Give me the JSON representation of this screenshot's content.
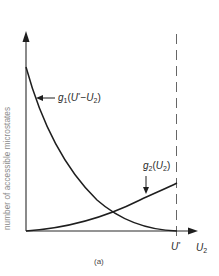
{
  "figure": {
    "caption": "(a)",
    "y_axis_label": "number of accessible microstates",
    "x_axis_label": {
      "base": "U",
      "sub": "2"
    },
    "marker_label": {
      "base": "U",
      "sup": "*"
    },
    "curves": {
      "g1": {
        "name": "g",
        "sub": "1",
        "arg_open": "(",
        "arg_base": "U",
        "arg_sup": "*",
        "arg_minus": "−",
        "arg_u": "U",
        "arg_sub": "2",
        "arg_close": ")",
        "description": "decreasing curve, maximal at U2=0, zero at U2=U*"
      },
      "g2": {
        "name": "g",
        "sub": "2",
        "arg_open": "(",
        "arg_u": "U",
        "arg_sub": "2",
        "arg_close": ")",
        "description": "increasing curve from zero at U2=0"
      }
    },
    "colors": {
      "line": "#1e1e1e",
      "axis": "#2a2a2a",
      "dashed": "#555555",
      "ylabel": "#8a8a8a"
    }
  }
}
